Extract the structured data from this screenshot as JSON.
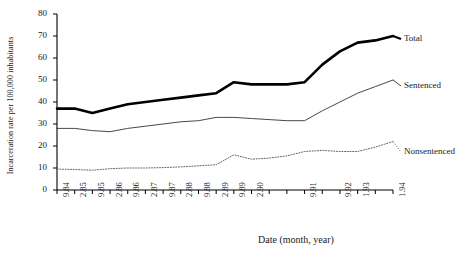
{
  "chart_data": {
    "type": "line",
    "title": "",
    "xlabel": "Date (month, year)",
    "ylabel": "Incarceration rate per 100,000 inhabitants",
    "ylim": [
      0,
      80
    ],
    "yticks": [
      0,
      10,
      20,
      30,
      40,
      50,
      60,
      70,
      80
    ],
    "grid": false,
    "legend_position": "right-inline",
    "categories": [
      "9.84",
      "2.85",
      "9.85",
      "2.86",
      "9.86",
      "2.87",
      "9.87",
      "2.88",
      "9.88",
      "2.89",
      "9.89",
      "2.90",
      "9.90",
      "2.91",
      "9.91",
      "2.92",
      "9.92",
      "1.93",
      "9.93",
      "1.94"
    ],
    "xtick_labels": [
      "9.84",
      "2.85",
      "9.85",
      "2.86",
      "9.86",
      "2.87",
      "9.87",
      "2.88",
      "9.88",
      "2.89",
      "9.89",
      "2.90",
      "",
      "",
      "9.91",
      "",
      "9.92",
      "1.93",
      "",
      "1.94"
    ],
    "series": [
      {
        "name": "Total",
        "style": "thick-solid",
        "color": "#000000",
        "values": [
          37,
          37,
          35,
          37,
          39,
          40,
          41,
          42,
          43,
          44,
          49,
          48,
          48,
          48,
          49,
          57,
          63,
          67,
          68,
          70
        ]
      },
      {
        "name": "Sentenced",
        "style": "thin-solid",
        "color": "#333333",
        "values": [
          28,
          28,
          27,
          26.5,
          28,
          29,
          30,
          31,
          31.5,
          33,
          33,
          32.5,
          32,
          31.5,
          31.5,
          36,
          40,
          44,
          47,
          50
        ]
      },
      {
        "name": "Nonsentenced",
        "style": "dotted",
        "color": "#555555",
        "values": [
          9.5,
          9.3,
          9,
          9.7,
          10,
          10,
          10.2,
          10.5,
          11,
          11.5,
          16,
          14,
          14.5,
          15.5,
          17.5,
          18,
          17.5,
          17.5,
          19.5,
          22
        ]
      }
    ]
  },
  "labels": {
    "total": "Total",
    "sentenced": "Sentenced",
    "nonsentenced": "Nonsentenced"
  }
}
